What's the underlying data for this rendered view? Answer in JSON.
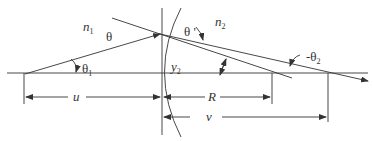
{
  "diagram": {
    "type": "optics-refraction-spherical-surface",
    "colors": {
      "line": "#333333",
      "background": "#ffffff"
    },
    "labels": {
      "n1": {
        "base": "n",
        "sub": "1"
      },
      "theta": "θ",
      "theta_prime": "θ '",
      "n2": {
        "base": "n",
        "sub": "2"
      },
      "theta1": {
        "base": "θ",
        "sub": "1"
      },
      "y2": {
        "base": "y",
        "sub": "2"
      },
      "neg_theta2": {
        "base": "-θ",
        "sub": "2"
      },
      "u": "u",
      "R": "R",
      "v": "v"
    }
  }
}
